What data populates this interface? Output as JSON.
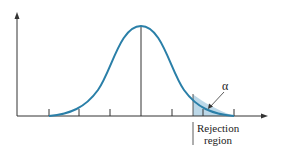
{
  "diagram": {
    "alpha_label": "α",
    "rejection_label_line1": "Rejection",
    "rejection_label_line2": "region",
    "colors": {
      "curve": "#2a7fa8",
      "shade": "#bcd8e8",
      "axis": "#333333"
    }
  }
}
